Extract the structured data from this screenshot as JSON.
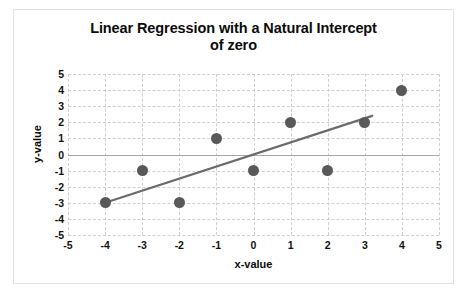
{
  "chart_data": {
    "type": "scatter",
    "title": "Linear Regression with a Natural Intercept of zero",
    "title_line1": "Linear Regression with a Natural Intercept",
    "title_line2": "of zero",
    "xlabel": "x-value",
    "ylabel": "y-value",
    "xlim": [
      -5,
      5
    ],
    "ylim": [
      -5,
      5
    ],
    "xticks": [
      "-5",
      "-4",
      "-3",
      "-2",
      "-1",
      "0",
      "1",
      "2",
      "3",
      "4",
      "5"
    ],
    "yticks": [
      "5",
      "4",
      "3",
      "2",
      "1",
      "0",
      "-1",
      "-2",
      "-3",
      "-4",
      "-5"
    ],
    "grid": true,
    "legend": false,
    "marker_color": "#595959",
    "line_color": "#6b6b6b",
    "grid_color": "#cfcfcf",
    "axis_color": "#a6a6a6",
    "x": [
      -4,
      -3,
      -2,
      -1,
      0,
      1,
      2,
      3,
      4
    ],
    "y": [
      -3,
      -1,
      -3,
      1,
      -1,
      2,
      -1,
      2,
      4
    ],
    "points": [
      {
        "x": -4,
        "y": -3
      },
      {
        "x": -3,
        "y": -1
      },
      {
        "x": -2,
        "y": -3
      },
      {
        "x": -1,
        "y": 1
      },
      {
        "x": 0,
        "y": -1
      },
      {
        "x": 1,
        "y": 2
      },
      {
        "x": 2,
        "y": -1
      },
      {
        "x": 3,
        "y": 2
      },
      {
        "x": 4,
        "y": 4
      }
    ],
    "series": [
      {
        "name": "Regression line",
        "type": "line",
        "intercept": 0,
        "slope": 0.75,
        "x_start": -4,
        "y_start": -3,
        "x_end": 3.2,
        "y_end": 2.4
      }
    ]
  }
}
